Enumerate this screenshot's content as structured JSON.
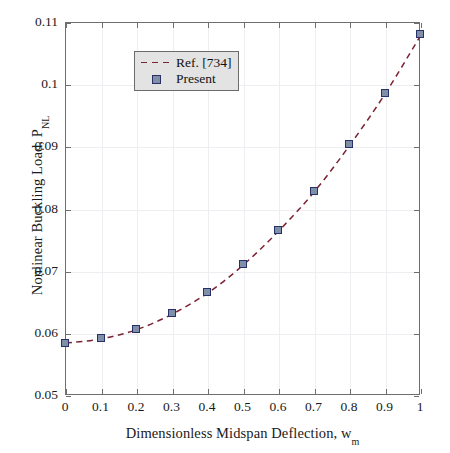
{
  "chart_data": {
    "type": "line",
    "title": "",
    "xlabel": "Dimensionless Midspan Deflection, w",
    "xlabel_sub": "m",
    "ylabel": "Nonlinear Buckling Load, P",
    "ylabel_sub": "NL",
    "xlim": [
      0,
      1
    ],
    "ylim": [
      0.05,
      0.11
    ],
    "grid": true,
    "legend_position": "top-left",
    "xticks": [
      "0",
      "0.1",
      "0.2",
      "0.3",
      "0.4",
      "0.5",
      "0.6",
      "0.7",
      "0.8",
      "0.9",
      "1"
    ],
    "xtick_values": [
      0,
      0.1,
      0.2,
      0.3,
      0.4,
      0.5,
      0.6,
      0.7,
      0.8,
      0.9,
      1
    ],
    "yticks": [
      "0.05",
      "0.06",
      "0.07",
      "0.08",
      "0.09",
      "0.1",
      "0.11"
    ],
    "ytick_values": [
      0.05,
      0.06,
      0.07,
      0.08,
      0.09,
      0.1,
      0.11
    ],
    "x": [
      0,
      0.1,
      0.2,
      0.3,
      0.4,
      0.5,
      0.6,
      0.7,
      0.8,
      0.9,
      1
    ],
    "series": [
      {
        "name": "Ref. [734]",
        "style": "dashed-line",
        "color": "#7b2233",
        "values": [
          0.0585,
          0.0592,
          0.0607,
          0.0632,
          0.0666,
          0.0711,
          0.0766,
          0.0829,
          0.0904,
          0.0987,
          0.1081
        ]
      },
      {
        "name": "Present",
        "style": "square-marker",
        "color": "#27306b",
        "fill": "#7e8fa6",
        "values": [
          0.0585,
          0.0592,
          0.0607,
          0.0632,
          0.0666,
          0.0711,
          0.0766,
          0.0829,
          0.0904,
          0.0987,
          0.1081
        ]
      }
    ]
  },
  "legend": {
    "items": [
      {
        "label": "Ref. [734]"
      },
      {
        "label": "Present"
      }
    ]
  },
  "colors": {
    "line": "#7b2233",
    "marker_edge": "#27306b",
    "marker_fill": "#7e8fa6",
    "axis": "#6e6e6e",
    "grid": "#ededf2",
    "background": "#ffffff",
    "legend_background": "#e3e3e3"
  }
}
